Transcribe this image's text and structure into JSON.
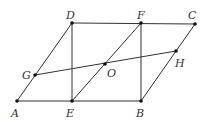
{
  "diagram": {
    "type": "geometry",
    "points": {
      "A": [
        17,
        101
      ],
      "E": [
        72,
        101
      ],
      "B": [
        141,
        101
      ],
      "D": [
        72,
        23
      ],
      "F": [
        141,
        23
      ],
      "C": [
        195,
        24
      ],
      "G": [
        35,
        75
      ],
      "O": [
        105,
        64
      ],
      "H": [
        176,
        51
      ]
    },
    "labels": [
      {
        "name": "A",
        "x": 11,
        "y": 117
      },
      {
        "name": "E",
        "x": 66,
        "y": 117
      },
      {
        "name": "B",
        "x": 136,
        "y": 117
      },
      {
        "name": "D",
        "x": 66,
        "y": 19
      },
      {
        "name": "F",
        "x": 137,
        "y": 19
      },
      {
        "name": "C",
        "x": 188,
        "y": 19
      },
      {
        "name": "G",
        "x": 22,
        "y": 79
      },
      {
        "name": "O",
        "x": 107,
        "y": 77
      },
      {
        "name": "H",
        "x": 175,
        "y": 67
      }
    ],
    "segments": [
      [
        "A",
        "B"
      ],
      [
        "B",
        "C"
      ],
      [
        "C",
        "D"
      ],
      [
        "D",
        "A"
      ],
      [
        "D",
        "E"
      ],
      [
        "E",
        "F"
      ],
      [
        "F",
        "B"
      ],
      [
        "G",
        "H"
      ]
    ]
  }
}
